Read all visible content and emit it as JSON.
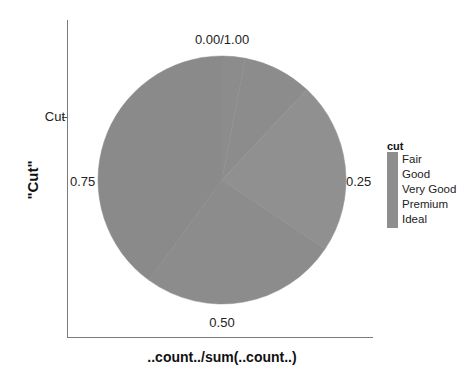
{
  "chart_data": {
    "type": "pie",
    "title": "",
    "xlabel": "..count../sum(..count..)",
    "ylabel": "\"Cut\"",
    "y_tick_labels": [
      "Cut"
    ],
    "angle_tick_labels": [
      "0.00/1.00",
      "0.25",
      "0.50",
      "0.75"
    ],
    "categories": [
      "Fair",
      "Good",
      "Very Good",
      "Premium",
      "Ideal"
    ],
    "values": [
      0.03,
      0.09,
      0.224,
      0.256,
      0.4
    ],
    "colors": [
      "#8c8c8c",
      "#8c8c8c",
      "#909090",
      "#8c8c8c",
      "#8a8a8a"
    ],
    "legend": {
      "title": "cut",
      "position": "right",
      "entries": [
        "Fair",
        "Good",
        "Very Good",
        "Premium",
        "Ideal"
      ]
    },
    "grid": false,
    "coord": "polar"
  },
  "labels": {
    "xlabel": "..count../sum(..count..)",
    "ylabel": "\"Cut\"",
    "ytick": "Cut",
    "angle_top": "0.00/1.00",
    "angle_right": "0.25",
    "angle_bottom": "0.50",
    "angle_left": "0.75"
  },
  "legend": {
    "title": "cut",
    "items": [
      "Fair",
      "Good",
      "Very Good",
      "Premium",
      "Ideal"
    ]
  }
}
